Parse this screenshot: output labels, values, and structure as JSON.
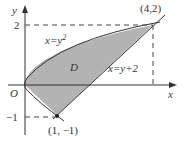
{
  "diagram": {
    "axes": {
      "x_label": "x",
      "y_label": "y",
      "origin_label": "O"
    },
    "ticks": {
      "y_top": "2",
      "y_bottom": "-1"
    },
    "curves": [
      {
        "name": "parabola",
        "equation": "x=y²",
        "label_main": "x=y",
        "label_sup": "2"
      },
      {
        "name": "line",
        "equation": "x=y+2",
        "label": "x=y+2"
      }
    ],
    "region": {
      "label": "D",
      "fill": "#b3b3b3"
    },
    "points": [
      {
        "label": "(4,2)",
        "x": 4,
        "y": 2
      },
      {
        "label": "(1, −1)",
        "x": 1,
        "y": -1
      }
    ],
    "colors": {
      "stroke": "#333333",
      "fill": "#b3b3b3",
      "dash": "#444444"
    }
  }
}
